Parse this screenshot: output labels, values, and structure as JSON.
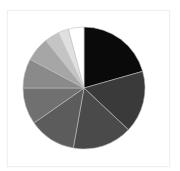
{
  "chart_data": {
    "type": "pie",
    "title": "",
    "start_angle_deg": 0,
    "direction": "clockwise",
    "legend": "none",
    "categories": [
      "Slice 1",
      "Slice 2",
      "Slice 3",
      "Slice 4",
      "Slice 5",
      "Slice 6",
      "Slice 7",
      "Slice 8",
      "Slice 9",
      "Slice 10"
    ],
    "values": [
      20.6,
      16.4,
      15.8,
      12.5,
      9.7,
      7.8,
      6.4,
      3.9,
      2.8,
      4.1
    ],
    "colors": [
      "#0a0a0a",
      "#3a3a3a",
      "#4a4a4a",
      "#5c5c5c",
      "#707070",
      "#8a8a8a",
      "#a6a6a6",
      "#c4c4c4",
      "#e0e0e0",
      "#ffffff"
    ],
    "center": [
      84,
      88
    ],
    "radius": 61,
    "separator_color": "#bdbdbd"
  }
}
